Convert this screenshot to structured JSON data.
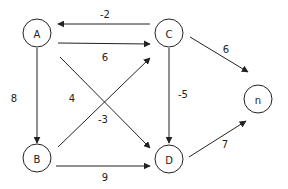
{
  "diagram": {
    "type": "directed-weighted-graph",
    "colors": {
      "stroke": "#222222",
      "background": "#ffffff"
    },
    "nodes": [
      {
        "id": "A",
        "label": "A",
        "x": 37,
        "y": 33
      },
      {
        "id": "C",
        "label": "C",
        "x": 169,
        "y": 33
      },
      {
        "id": "n",
        "label": "n",
        "x": 258,
        "y": 99
      },
      {
        "id": "B",
        "label": "B",
        "x": 37,
        "y": 158
      },
      {
        "id": "D",
        "label": "D",
        "x": 169,
        "y": 159
      }
    ],
    "edges": [
      {
        "from": "C",
        "to": "A",
        "weight": "-2"
      },
      {
        "from": "A",
        "to": "C",
        "weight": "6"
      },
      {
        "from": "A",
        "to": "B",
        "weight": "8"
      },
      {
        "from": "B",
        "to": "C",
        "weight": "4"
      },
      {
        "from": "A",
        "to": "D",
        "weight": "-3"
      },
      {
        "from": "C",
        "to": "D",
        "weight": "-5"
      },
      {
        "from": "C",
        "to": "n",
        "weight": "6"
      },
      {
        "from": "D",
        "to": "n",
        "weight": "7"
      },
      {
        "from": "B",
        "to": "D",
        "weight": "9"
      }
    ]
  }
}
